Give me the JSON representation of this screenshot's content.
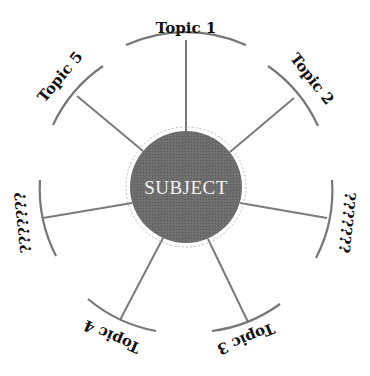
{
  "diagram": {
    "type": "spider-map",
    "center": {
      "label": "SUBJECT",
      "fill": "#6b6b6b"
    },
    "branches": [
      {
        "id": "topic-1",
        "label": "Topic 1",
        "angle_deg": -90
      },
      {
        "id": "topic-2",
        "label": "Topic 2",
        "angle_deg": -38
      },
      {
        "id": "unknown-right",
        "label": "???????",
        "angle_deg": 16
      },
      {
        "id": "topic-3",
        "label": "Topic 3",
        "angle_deg": 67
      },
      {
        "id": "topic-4",
        "label": "Topic 4",
        "angle_deg": 114
      },
      {
        "id": "unknown-left",
        "label": "???????",
        "angle_deg": 164
      },
      {
        "id": "topic-5",
        "label": "Topic 5",
        "angle_deg": -140
      }
    ],
    "colors": {
      "line": "#7a7a7a",
      "text": "#111111",
      "circle": "#6b6b6b"
    }
  }
}
